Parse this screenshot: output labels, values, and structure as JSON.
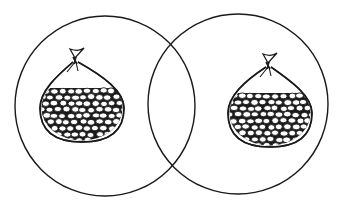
{
  "diagram": {
    "type": "venn",
    "background": "#ffffff",
    "stroke_color": "#1a1a1a",
    "sets": [
      {
        "id": "left",
        "cx": 105,
        "cy": 106,
        "r": 90,
        "contents": "bag-of-beans"
      },
      {
        "id": "right",
        "cx": 238,
        "cy": 104,
        "r": 90,
        "contents": "bag-of-beans"
      }
    ],
    "intersection": {
      "contents": "empty"
    },
    "bags": [
      {
        "id": "left-bag",
        "cx": 82,
        "cy": 108,
        "rx": 42,
        "ry": 34,
        "tie_x": 75,
        "tie_y": 52,
        "bean_top": 88
      },
      {
        "id": "right-bag",
        "cx": 270,
        "cy": 113,
        "rx": 42,
        "ry": 34,
        "tie_x": 268,
        "tie_y": 57,
        "bean_top": 93
      }
    ]
  }
}
